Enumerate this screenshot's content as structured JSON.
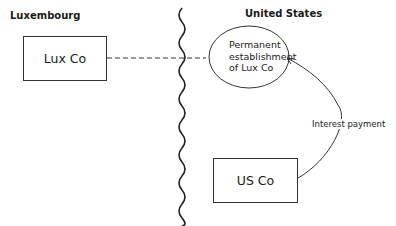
{
  "regions": {
    "left": {
      "label": "Luxembourg"
    },
    "right": {
      "label": "United States"
    }
  },
  "nodes": {
    "lux_co": {
      "label": "Lux Co"
    },
    "permanent_establishment": {
      "lines": [
        "Permanent",
        "establishment",
        "of Lux Co"
      ]
    },
    "us_co": {
      "label": "US Co"
    }
  },
  "edges": {
    "lux_to_pe": {
      "style": "dashed"
    },
    "us_to_pe": {
      "label": "Interest payment",
      "style": "solid-arrow"
    }
  },
  "colors": {
    "line": "#333333",
    "background": "#ffffff"
  }
}
